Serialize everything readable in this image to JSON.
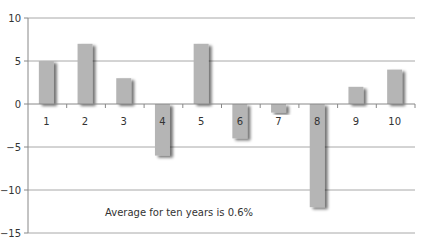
{
  "chart_data": {
    "type": "bar",
    "title": "",
    "xlabel": "",
    "ylabel": "",
    "categories": [
      "1",
      "2",
      "3",
      "4",
      "5",
      "6",
      "7",
      "8",
      "9",
      "10"
    ],
    "values": [
      5,
      7,
      3,
      -6,
      7,
      -4,
      -1,
      -12,
      2,
      4
    ],
    "ylim": [
      -15,
      10
    ],
    "yticks": [
      10,
      5,
      0,
      -5,
      -10,
      -15
    ],
    "ytick_labels": [
      "10",
      "5",
      "0",
      "−5",
      "−10",
      "−15"
    ],
    "grid": true,
    "legend": null,
    "annotations": [
      "Average for ten years is 0.6%"
    ]
  },
  "colors": {
    "bar": "#b5b5b5",
    "bar_shadow": "#8a8a8a",
    "grid": "#a8a8a8",
    "axis": "#888888",
    "text": "#333333"
  },
  "annotation_text": "Average for ten years is 0.6%"
}
